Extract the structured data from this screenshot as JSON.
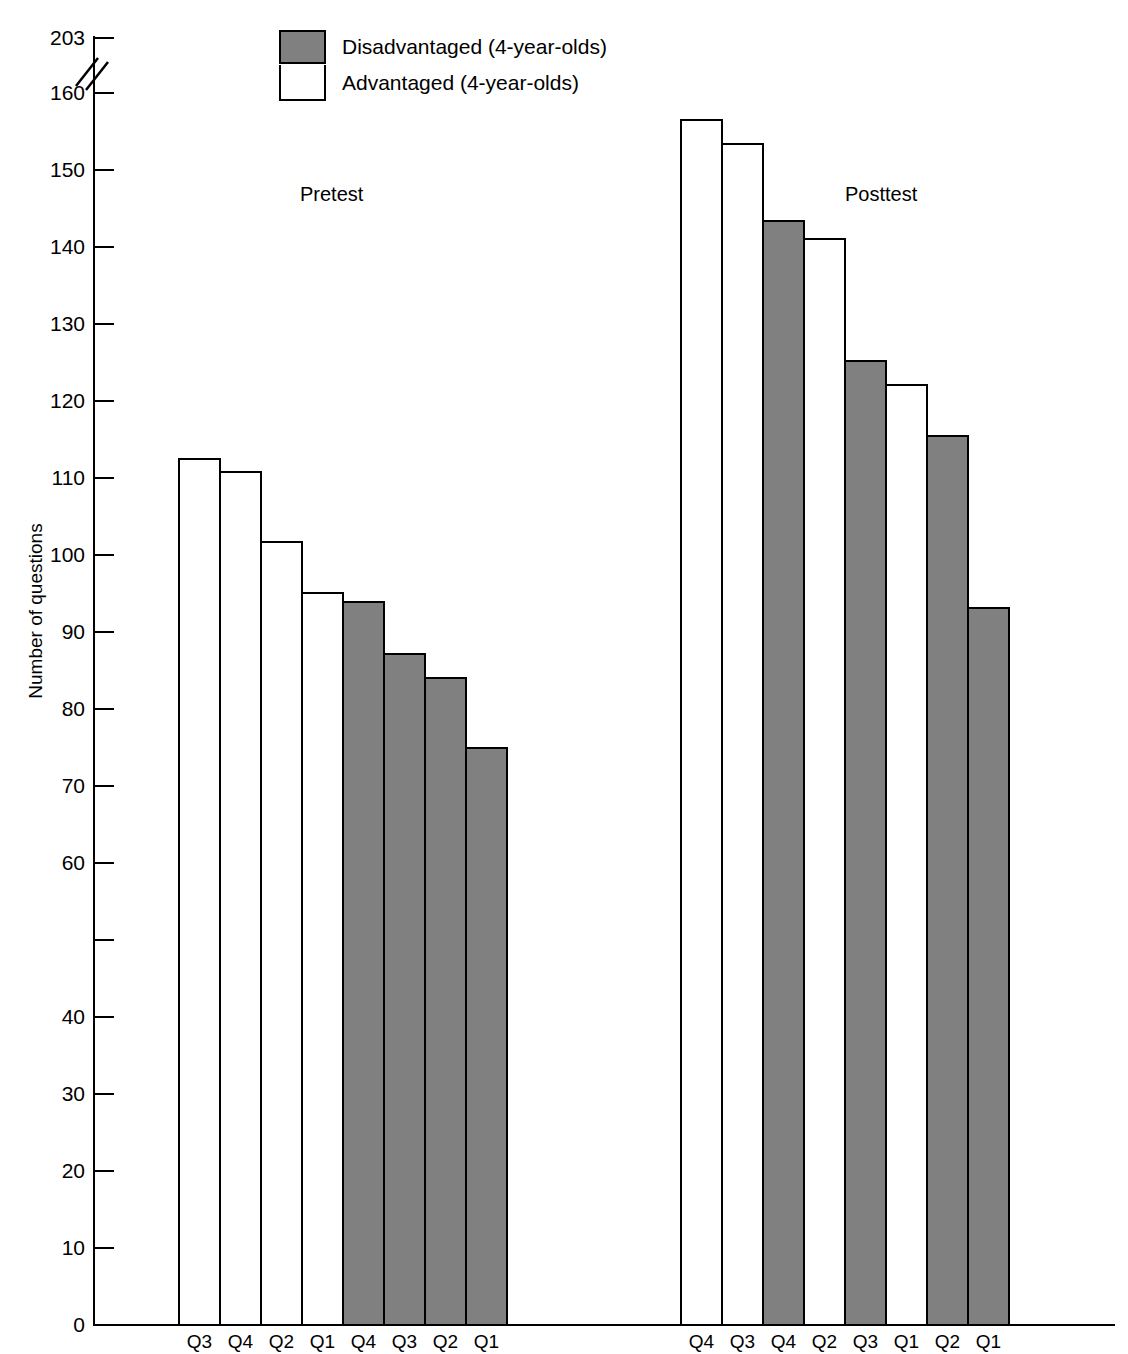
{
  "chart_data": {
    "type": "bar",
    "title": "",
    "xlabel": "",
    "ylabel": "Number of questions",
    "ylim": [
      0,
      203
    ],
    "y_axis_break": {
      "below": 160,
      "above": 203,
      "present": true
    },
    "grid": false,
    "yticks": [
      {
        "value": 203,
        "label": "203"
      },
      {
        "value": 160,
        "label": "160"
      },
      {
        "value": 150,
        "label": "150"
      },
      {
        "value": 140,
        "label": "140"
      },
      {
        "value": 130,
        "label": "130"
      },
      {
        "value": 120,
        "label": "120"
      },
      {
        "value": 110,
        "label": "110"
      },
      {
        "value": 100,
        "label": "100"
      },
      {
        "value": 90,
        "label": "90"
      },
      {
        "value": 80,
        "label": "80"
      },
      {
        "value": 70,
        "label": "70"
      },
      {
        "value": 60,
        "label": "60"
      },
      {
        "value": 50,
        "label": ""
      },
      {
        "value": 40,
        "label": "40"
      },
      {
        "value": 30,
        "label": "30"
      },
      {
        "value": 20,
        "label": "20"
      },
      {
        "value": 10,
        "label": "10"
      },
      {
        "value": 0,
        "label": "0"
      }
    ],
    "legend": {
      "position": "top-center",
      "entries": [
        {
          "name": "Disadvantaged (4-year-olds)",
          "color": "#808080"
        },
        {
          "name": "Advantaged (4-year-olds)",
          "color": "#ffffff"
        }
      ]
    },
    "groups": [
      {
        "name": "Pretest",
        "bars": [
          {
            "category": "Q3",
            "series": "Advantaged (4-year-olds)",
            "value": 112.7
          },
          {
            "category": "Q4",
            "series": "Advantaged (4-year-olds)",
            "value": 111.0
          },
          {
            "category": "Q2",
            "series": "Advantaged (4-year-olds)",
            "value": 102.0
          },
          {
            "category": "Q1",
            "series": "Advantaged (4-year-olds)",
            "value": 95.3
          },
          {
            "category": "Q4",
            "series": "Disadvantaged (4-year-olds)",
            "value": 94.2
          },
          {
            "category": "Q3",
            "series": "Disadvantaged (4-year-olds)",
            "value": 87.4
          },
          {
            "category": "Q2",
            "series": "Disadvantaged (4-year-olds)",
            "value": 84.3
          },
          {
            "category": "Q1",
            "series": "Disadvantaged (4-year-olds)",
            "value": 75.2
          }
        ]
      },
      {
        "name": "Posttest",
        "bars": [
          {
            "category": "Q4",
            "series": "Advantaged (4-year-olds)",
            "value": 156.8
          },
          {
            "category": "Q3",
            "series": "Advantaged (4-year-olds)",
            "value": 153.6
          },
          {
            "category": "Q4",
            "series": "Disadvantaged (4-year-olds)",
            "value": 143.6
          },
          {
            "category": "Q2",
            "series": "Advantaged (4-year-olds)",
            "value": 141.3
          },
          {
            "category": "Q3",
            "series": "Disadvantaged (4-year-olds)",
            "value": 125.4
          },
          {
            "category": "Q1",
            "series": "Advantaged (4-year-olds)",
            "value": 122.4
          },
          {
            "category": "Q2",
            "series": "Disadvantaged (4-year-olds)",
            "value": 115.7
          },
          {
            "category": "Q1",
            "series": "Disadvantaged (4-year-olds)",
            "value": 93.4
          }
        ]
      }
    ]
  }
}
